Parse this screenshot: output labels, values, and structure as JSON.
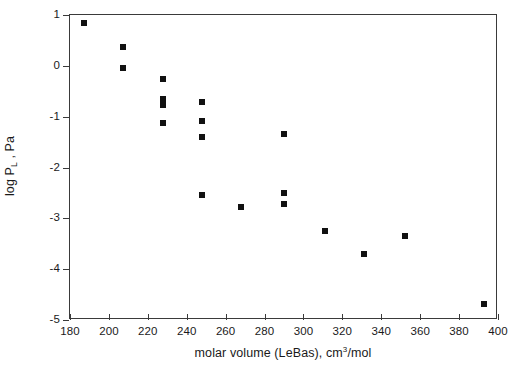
{
  "chart_data": {
    "type": "scatter",
    "title": "",
    "xlabel_parts": {
      "pre": "molar volume (LeBas), cm",
      "sup": "3",
      "post": "/mol"
    },
    "xlabel": "molar volume (LeBas), cm3/mol",
    "ylabel_parts": {
      "pre": "log P",
      "sub": "L",
      "post": " , Pa"
    },
    "ylabel": "log P_L , Pa",
    "xlim": [
      180,
      400
    ],
    "ylim": [
      -5,
      1
    ],
    "xticks": [
      180,
      200,
      220,
      240,
      260,
      280,
      300,
      320,
      340,
      360,
      380,
      400
    ],
    "yticks": [
      1,
      0,
      -1,
      -2,
      -3,
      -4,
      -5
    ],
    "xtick_labels": [
      "180",
      "200",
      "220",
      "240",
      "260",
      "280",
      "300",
      "320",
      "340",
      "360",
      "380",
      "400"
    ],
    "ytick_labels": [
      "1",
      "0",
      "-1",
      "-2",
      "-3",
      "-4",
      "-5"
    ],
    "grid": false,
    "legend": null,
    "marker": "filled-square",
    "marker_color": "#111111",
    "points": [
      {
        "x": 187,
        "y": 0.85
      },
      {
        "x": 207,
        "y": 0.37
      },
      {
        "x": 207,
        "y": -0.05
      },
      {
        "x": 228,
        "y": -0.25
      },
      {
        "x": 228,
        "y": -0.65
      },
      {
        "x": 228,
        "y": -0.78
      },
      {
        "x": 228,
        "y": -1.12
      },
      {
        "x": 248,
        "y": -0.72
      },
      {
        "x": 248,
        "y": -1.08
      },
      {
        "x": 248,
        "y": -1.4
      },
      {
        "x": 248,
        "y": -2.55
      },
      {
        "x": 268,
        "y": -2.78
      },
      {
        "x": 290,
        "y": -1.35
      },
      {
        "x": 290,
        "y": -2.5
      },
      {
        "x": 290,
        "y": -2.72
      },
      {
        "x": 311,
        "y": -3.25
      },
      {
        "x": 331,
        "y": -3.7
      },
      {
        "x": 352,
        "y": -3.35
      },
      {
        "x": 393,
        "y": -4.68
      }
    ]
  }
}
